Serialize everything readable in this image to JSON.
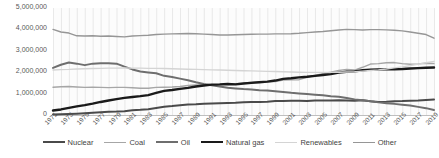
{
  "chart_data": {
    "type": "line",
    "title": "",
    "xlabel": "",
    "ylabel": "",
    "ylim": [
      0,
      5000000
    ],
    "yticks": [
      "0",
      "1,000,000",
      "2,000,000",
      "3,000,000",
      "4,000,000",
      "5,000,000"
    ],
    "ytick_values": [
      0,
      1000000,
      2000000,
      3000000,
      4000000,
      5000000
    ],
    "grid": "vertical",
    "legend_position": "bottom",
    "x": [
      1971,
      1972,
      1973,
      1974,
      1975,
      1976,
      1977,
      1978,
      1979,
      1980,
      1981,
      1982,
      1983,
      1984,
      1985,
      1986,
      1987,
      1988,
      1989,
      1990,
      1991,
      1992,
      1993,
      1994,
      1995,
      1996,
      1997,
      1998,
      1999,
      2000,
      2001,
      2002,
      2003,
      2004,
      2005,
      2006,
      2007,
      2008,
      2009,
      2010,
      2011,
      2012,
      2013,
      2014,
      2015,
      2016,
      2017,
      2018,
      2019
    ],
    "xtick_labels": [
      "1971",
      "1973",
      "1975",
      "1977",
      "1979",
      "1981",
      "1983",
      "1985",
      "1987",
      "1989",
      "1991",
      "1993",
      "1995",
      "1997",
      "1999",
      "2001",
      "2003",
      "2005",
      "2007",
      "2009",
      "2011",
      "2013",
      "2015",
      "2017",
      "2019"
    ],
    "series": [
      {
        "name": "Nuclear",
        "color": "#4a4a4a",
        "width": 2.0,
        "values": [
          20000,
          30000,
          45000,
          60000,
          80000,
          100000,
          125000,
          150000,
          160000,
          180000,
          220000,
          240000,
          270000,
          330000,
          390000,
          420000,
          460000,
          490000,
          500000,
          520000,
          540000,
          550000,
          560000,
          570000,
          590000,
          610000,
          610000,
          620000,
          650000,
          660000,
          670000,
          670000,
          660000,
          680000,
          680000,
          680000,
          690000,
          680000,
          670000,
          690000,
          640000,
          610000,
          620000,
          640000,
          650000,
          670000,
          680000,
          700000,
          720000
        ]
      },
      {
        "name": "Coal",
        "color": "#a6a6a6",
        "width": 1.4,
        "values": [
          1300000,
          1320000,
          1330000,
          1310000,
          1290000,
          1300000,
          1290000,
          1280000,
          1290000,
          1290000,
          1270000,
          1250000,
          1250000,
          1290000,
          1300000,
          1310000,
          1330000,
          1380000,
          1400000,
          1410000,
          1420000,
          1420000,
          1450000,
          1460000,
          1490000,
          1530000,
          1560000,
          1550000,
          1560000,
          1630000,
          1640000,
          1650000,
          1760000,
          1850000,
          1930000,
          2000000,
          2080000,
          2130000,
          2100000,
          2230000,
          2380000,
          2400000,
          2440000,
          2450000,
          2400000,
          2370000,
          2390000,
          2420000,
          2400000
        ]
      },
      {
        "name": "Oil",
        "color": "#6e6e6e",
        "width": 2.0,
        "values": [
          2200000,
          2350000,
          2450000,
          2400000,
          2330000,
          2400000,
          2420000,
          2420000,
          2400000,
          2260000,
          2130000,
          2030000,
          1990000,
          1950000,
          1830000,
          1780000,
          1700000,
          1620000,
          1530000,
          1450000,
          1390000,
          1330000,
          1270000,
          1240000,
          1210000,
          1190000,
          1160000,
          1140000,
          1110000,
          1080000,
          1040000,
          1010000,
          980000,
          950000,
          920000,
          880000,
          850000,
          790000,
          730000,
          690000,
          640000,
          590000,
          550000,
          520000,
          480000,
          440000,
          380000,
          320000,
          230000
        ]
      },
      {
        "name": "Natural gas",
        "color": "#1a1a1a",
        "width": 2.4,
        "values": [
          210000,
          260000,
          330000,
          400000,
          460000,
          530000,
          610000,
          680000,
          740000,
          800000,
          840000,
          880000,
          930000,
          1030000,
          1130000,
          1170000,
          1220000,
          1270000,
          1330000,
          1380000,
          1420000,
          1430000,
          1450000,
          1430000,
          1470000,
          1500000,
          1530000,
          1560000,
          1610000,
          1690000,
          1720000,
          1760000,
          1790000,
          1830000,
          1870000,
          1910000,
          1980000,
          2020000,
          2040000,
          2090000,
          2120000,
          2130000,
          2130000,
          2140000,
          2150000,
          2170000,
          2190000,
          2210000,
          2220000
        ]
      },
      {
        "name": "Renewables",
        "color": "#d4d4d4",
        "width": 1.4,
        "values": [
          2100000,
          2120000,
          2130000,
          2150000,
          2160000,
          2170000,
          2180000,
          2190000,
          2190000,
          2200000,
          2190000,
          2190000,
          2180000,
          2180000,
          2170000,
          2160000,
          2150000,
          2140000,
          2130000,
          2120000,
          2110000,
          2100000,
          2090000,
          2080000,
          2070000,
          2060000,
          2050000,
          2040000,
          2030000,
          2020000,
          2010000,
          2000000,
          1990000,
          1990000,
          1990000,
          1990000,
          2000000,
          2010000,
          2020000,
          2050000,
          2080000,
          2110000,
          2150000,
          2200000,
          2250000,
          2310000,
          2380000,
          2440000,
          2500000
        ]
      },
      {
        "name": "Other",
        "color": "#969696",
        "width": 1.4,
        "values": [
          4000000,
          3880000,
          3830000,
          3700000,
          3690000,
          3700000,
          3680000,
          3690000,
          3670000,
          3650000,
          3690000,
          3710000,
          3730000,
          3760000,
          3780000,
          3790000,
          3800000,
          3810000,
          3800000,
          3780000,
          3760000,
          3740000,
          3740000,
          3750000,
          3760000,
          3770000,
          3780000,
          3780000,
          3790000,
          3790000,
          3800000,
          3820000,
          3850000,
          3880000,
          3900000,
          3940000,
          3970000,
          4000000,
          3990000,
          3970000,
          3990000,
          3990000,
          3980000,
          3960000,
          3930000,
          3880000,
          3820000,
          3760000,
          3590000
        ]
      }
    ]
  },
  "legend": {
    "items": [
      {
        "label": "Nuclear",
        "color": "#4a4a4a",
        "width": 2.0
      },
      {
        "label": "Coal",
        "color": "#a6a6a6",
        "width": 1.4
      },
      {
        "label": "Oil",
        "color": "#6e6e6e",
        "width": 2.0
      },
      {
        "label": "Natural gas",
        "color": "#1a1a1a",
        "width": 2.4
      },
      {
        "label": "Renewables",
        "color": "#d4d4d4",
        "width": 1.4
      },
      {
        "label": "Other",
        "color": "#969696",
        "width": 1.4
      }
    ]
  }
}
